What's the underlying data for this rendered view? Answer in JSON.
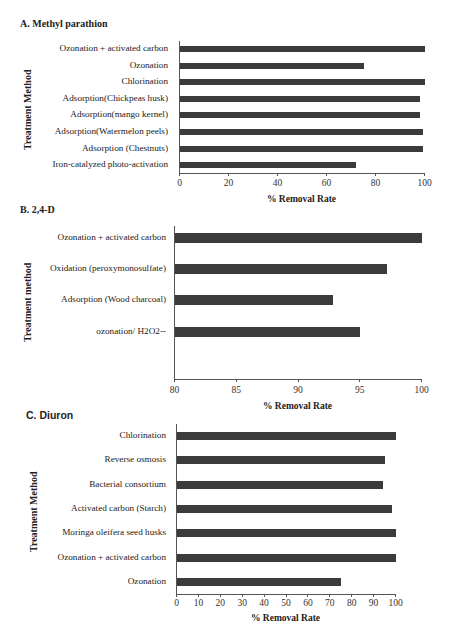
{
  "chart_data": [
    {
      "type": "bar",
      "orientation": "horizontal",
      "title": "A. Methyl parathion",
      "xlabel": "% Removal Rate",
      "ylabel": "Treatment Method",
      "xlim": [
        0,
        100
      ],
      "xticks": [
        0,
        20,
        40,
        60,
        80,
        100
      ],
      "categories": [
        "Ozonation + activated carbon",
        "Ozonation",
        "Chlorination",
        "Adsorption(Chickpeas husk)",
        "Adsorption(mango kernel)",
        "Adsorption(Watermelon peels)",
        "Adsorption (Chestnuts)",
        "Iron-catalyzed photo-activation"
      ],
      "values": [
        100,
        75,
        100,
        98,
        98,
        99,
        99,
        72
      ],
      "color": "#3b3b3b",
      "grid": false,
      "legend": null
    },
    {
      "type": "bar",
      "orientation": "horizontal",
      "title": "B. 2,4-D",
      "xlabel": "% Removal Rate",
      "ylabel": "Treatment method",
      "xlim": [
        80,
        100
      ],
      "xticks": [
        80,
        85,
        90,
        95,
        100
      ],
      "categories": [
        "Ozonation + activated carbon",
        "Oxidation (peroxymonosulfate)",
        "Adsorption (Wood charcoal)",
        "ozonation/ H2O2--"
      ],
      "values": [
        100,
        97.2,
        92.8,
        95
      ],
      "color": "#3b3b3b",
      "grid": false,
      "legend": null
    },
    {
      "type": "bar",
      "orientation": "horizontal",
      "title": "C. Diuron",
      "xlabel": "% Removal Rate",
      "ylabel": "Treatment Method",
      "xlim": [
        0,
        100
      ],
      "xticks": [
        0,
        10,
        20,
        30,
        40,
        50,
        60,
        70,
        80,
        90,
        100
      ],
      "categories": [
        "Chlorination",
        "Reverse osmosis",
        "Bacterial consortium",
        "Activated carbon (Starch)",
        "Moringa oleifera seed husks",
        "Ozonation + activated carbon",
        "Ozonation"
      ],
      "values": [
        100,
        95,
        94,
        98,
        100,
        100,
        75
      ],
      "color": "#3b3b3b",
      "grid": false,
      "legend": null
    }
  ],
  "layout": [
    {
      "title_pos": [
        20,
        26
      ],
      "title_sans": false,
      "ylab_pos": [
        29,
        150
      ],
      "axis_x": 179,
      "axis_right": 424,
      "axis_top": 41,
      "axis_bottom": 173,
      "bar_first_y": 46,
      "bar_step": 16.6,
      "bar_h": 6,
      "label_right": 168,
      "tick_label_y": 178,
      "xlabel_y": 194
    },
    {
      "title_pos": [
        20,
        212
      ],
      "title_sans": false,
      "ylab_pos": [
        29,
        342
      ],
      "axis_x": 174,
      "axis_right": 421,
      "axis_top": 226,
      "axis_bottom": 379,
      "bar_first_y": 233,
      "bar_step": 31.2,
      "bar_h": 10,
      "label_right": 166,
      "tick_label_y": 385,
      "xlabel_y": 401
    },
    {
      "title_pos": [
        26,
        417
      ],
      "title_sans": true,
      "ylab_pos": [
        35,
        552
      ],
      "axis_x": 176,
      "axis_right": 395,
      "axis_top": 424,
      "axis_bottom": 594,
      "bar_first_y": 432,
      "bar_step": 24.3,
      "bar_h": 8,
      "label_right": 166,
      "tick_label_y": 598,
      "xlabel_y": 613
    }
  ]
}
